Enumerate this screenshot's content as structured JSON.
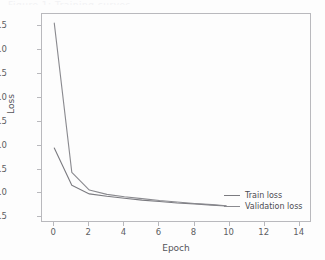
{
  "figure": {
    "background_color": "#fdfdfd",
    "axes_frame_color": "#b9b9bd",
    "caption_sliver": "Figure 1: Training curves"
  },
  "axis": {
    "xlabel": "Epoch",
    "ylabel": "Loss",
    "xticks": [
      "0",
      "2",
      "4",
      "6",
      "8",
      "10",
      "12",
      "14"
    ],
    "yticks": [
      "0.5",
      "1.0",
      "1.5",
      "2.0",
      "2.5",
      "3.0",
      "3.5",
      "4.0",
      "4.5"
    ]
  },
  "legend": {
    "position": "lower-right",
    "items": [
      {
        "label": "Train loss",
        "color": "#7b7b80"
      },
      {
        "label": "Validation loss",
        "color": "#8a8a8f"
      }
    ]
  },
  "chart_data": {
    "type": "line",
    "title": "",
    "subtitle": "",
    "xlabel": "Epoch",
    "ylabel": "Loss",
    "xlim": [
      -0.7,
      14.7
    ],
    "ylim": [
      0.38,
      4.76
    ],
    "grid": false,
    "legend_position": "lower right",
    "x": [
      0,
      1,
      2,
      3,
      4,
      5,
      6,
      7,
      8,
      9,
      9.8
    ],
    "series": [
      {
        "name": "Train loss",
        "color": "#7b7b80",
        "values": [
          1.95,
          1.17,
          0.99,
          0.94,
          0.9,
          0.86,
          0.83,
          0.8,
          0.78,
          0.755,
          0.735
        ]
      },
      {
        "name": "Validation loss",
        "color": "#8a8a8f",
        "values": [
          4.57,
          1.44,
          1.07,
          0.98,
          0.93,
          0.89,
          0.85,
          0.82,
          0.79,
          0.765,
          0.74
        ]
      }
    ],
    "annotations": []
  }
}
